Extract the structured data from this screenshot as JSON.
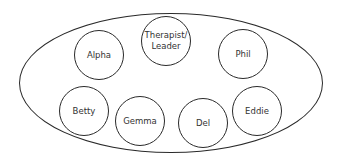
{
  "diagram": {
    "type": "group-membership",
    "colors": {
      "stroke": "#2a2a2a",
      "text": "#333333",
      "background": "#ffffff"
    },
    "group": {
      "cx": 171,
      "cy": 83,
      "rx": 152,
      "ry": 70
    },
    "members": [
      {
        "id": "alpha",
        "label": "Alpha",
        "cx": 99,
        "cy": 55,
        "r": 25
      },
      {
        "id": "therapist-leader",
        "label": "Therapist/\nLeader",
        "cx": 166,
        "cy": 41,
        "r": 25
      },
      {
        "id": "phil",
        "label": "Phil",
        "cx": 243,
        "cy": 54,
        "r": 25
      },
      {
        "id": "betty",
        "label": "Betty",
        "cx": 84,
        "cy": 111,
        "r": 25
      },
      {
        "id": "gemma",
        "label": "Gemma",
        "cx": 140,
        "cy": 121,
        "r": 25
      },
      {
        "id": "del",
        "label": "Del",
        "cx": 203,
        "cy": 123,
        "r": 25
      },
      {
        "id": "eddie",
        "label": "Eddie",
        "cx": 257,
        "cy": 111,
        "r": 25
      }
    ]
  }
}
